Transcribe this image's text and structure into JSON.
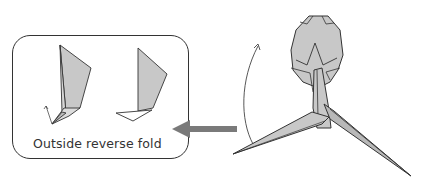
{
  "diagram": {
    "type": "origami-instruction",
    "inset": {
      "caption": "Outside reverse fold",
      "steps": [
        "before-fold",
        "after-fold"
      ]
    },
    "arrow": {
      "direction": "left",
      "meaning": "detail-of-step"
    },
    "main_figure": {
      "subject": "origami-model-head-and-legs",
      "rotation_arrow": "curved-up"
    },
    "colors": {
      "paper": "#c8c8c8",
      "outline": "#333333",
      "arrow": "#7a7a7a"
    }
  }
}
